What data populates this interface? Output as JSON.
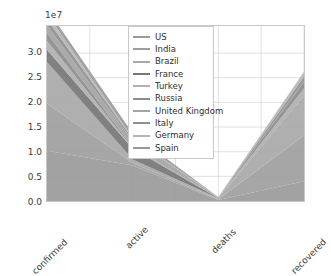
{
  "chart_data": {
    "type": "area",
    "stacked": true,
    "title": "",
    "xlabel": "",
    "ylabel": "",
    "categories": [
      "confirmed",
      "active",
      "deaths",
      "recovered"
    ],
    "offset_label": "1e7",
    "y_scale": 10000000,
    "ylim": [
      0,
      3.55
    ],
    "ytick_labels": [
      "0.0",
      "0.5",
      "1.0",
      "1.5",
      "2.0",
      "2.5",
      "3.0"
    ],
    "ytick_values": [
      0.0,
      0.5,
      1.0,
      1.5,
      2.0,
      2.5,
      3.0
    ],
    "grid": true,
    "legend_position": "upper center",
    "series": [
      {
        "name": "US",
        "color": "#9a9a9a",
        "values": [
          1.02,
          0.72,
          0.022,
          0.4
        ]
      },
      {
        "name": "India",
        "color": "#9e9e9e",
        "values": [
          0.96,
          0.05,
          0.014,
          0.93
        ]
      },
      {
        "name": "Brazil",
        "color": "#a8a8a8",
        "values": [
          0.84,
          0.07,
          0.021,
          0.76
        ]
      },
      {
        "name": "France",
        "color": "#767676",
        "values": [
          0.25,
          0.22,
          0.006,
          0.02
        ]
      },
      {
        "name": "Turkey",
        "color": "#b0b0b0",
        "values": [
          0.18,
          0.01,
          0.002,
          0.17
        ]
      },
      {
        "name": "Russia",
        "color": "#8c8c8c",
        "values": [
          0.16,
          0.02,
          0.003,
          0.14
        ]
      },
      {
        "name": "United Kingdom",
        "color": "#a3a3a3",
        "values": [
          0.15,
          0.13,
          0.005,
          0.01
        ]
      },
      {
        "name": "Italy",
        "color": "#8f8f8f",
        "values": [
          0.13,
          0.04,
          0.004,
          0.09
        ]
      },
      {
        "name": "Germany",
        "color": "#b5b5b5",
        "values": [
          0.11,
          0.02,
          0.002,
          0.09
        ]
      },
      {
        "name": "Spain",
        "color": "#999999",
        "values": [
          0.1,
          0.09,
          0.003,
          0.01
        ]
      }
    ],
    "stack_totals": [
      3.3,
      1.32,
      0.082,
      2.38
    ],
    "axis_colors": {
      "frame": "#c9c9c9",
      "grid": "#d8d8d8",
      "tick_text": "#3c3c3c",
      "background": "#ffffff"
    }
  }
}
